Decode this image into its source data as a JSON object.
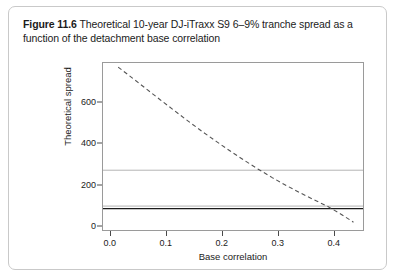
{
  "caption": {
    "figure_number": "Figure 11.6",
    "text": " Theoretical 10-year DJ-iTraxx S9 6–9% tranche spread as a function of the detachment base correlation"
  },
  "chart_data": {
    "type": "line",
    "title": "Theoretical 10-year DJ-iTraxx S9 6–9% tranche spread as a function of the detachment base correlation",
    "xlabel": "Base correlation",
    "ylabel": "Theoretical spread",
    "xlim": [
      -0.012,
      0.452
    ],
    "ylim": [
      -20,
      790
    ],
    "xticks": [
      0.0,
      0.1,
      0.2,
      0.3,
      0.4
    ],
    "xtick_labels": [
      "0.0",
      "0.1",
      "0.2",
      "0.3",
      "0.4"
    ],
    "yticks": [
      0,
      200,
      400,
      600
    ],
    "ytick_labels": [
      "0",
      "200",
      "400",
      "600"
    ],
    "grid": false,
    "legend": "none",
    "series": [
      {
        "name": "Theoretical spread curve",
        "style": "dashed",
        "color": "#555555",
        "x": [
          0.015,
          0.04,
          0.065,
          0.09,
          0.115,
          0.14,
          0.165,
          0.19,
          0.215,
          0.24,
          0.265,
          0.29,
          0.315,
          0.34,
          0.365,
          0.39,
          0.412,
          0.435
        ],
        "values": [
          770,
          718,
          665,
          612,
          560,
          508,
          458,
          410,
          363,
          318,
          275,
          234,
          196,
          160,
          126,
          93,
          58,
          18
        ]
      },
      {
        "name": "Upper reference level",
        "style": "solid",
        "color": "#b4b4b4",
        "constant_y": 270
      },
      {
        "name": "Middle reference level",
        "style": "solid",
        "color": "#b4b4b4",
        "constant_y": 96
      },
      {
        "name": "Lower reference level",
        "style": "solid",
        "color": "#1b1b1b",
        "constant_y": 84
      }
    ]
  }
}
